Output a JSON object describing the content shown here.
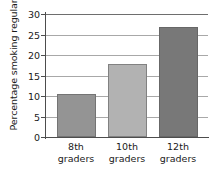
{
  "chart_data": {
    "type": "bar",
    "title": "",
    "subtitle": "",
    "xlabel": "",
    "ylabel": "Percentage smoking regularly",
    "categories": [
      "8th graders",
      "10th graders",
      "12th graders"
    ],
    "category_lines": [
      [
        "8th",
        "graders"
      ],
      [
        "10th",
        "graders"
      ],
      [
        "12th",
        "graders"
      ]
    ],
    "values": [
      10.6,
      17.8,
      26.8
    ],
    "bar_colors": [
      "#949494",
      "#b2b2b2",
      "#787878"
    ],
    "ylim": [
      0,
      30
    ],
    "y_ticks": [
      0,
      5,
      10,
      15,
      20,
      25,
      30
    ],
    "y_tick_labels": [
      "0",
      "5",
      "10",
      "15",
      "20",
      "25",
      "30"
    ],
    "grid": true,
    "grid_axis": "y",
    "legend": false,
    "legend_position": "none",
    "axis_color": "#4d4d4d",
    "grid_color": "#a8a8a8",
    "background_color": "#ffffff",
    "text_color": "#1a1a1a"
  }
}
